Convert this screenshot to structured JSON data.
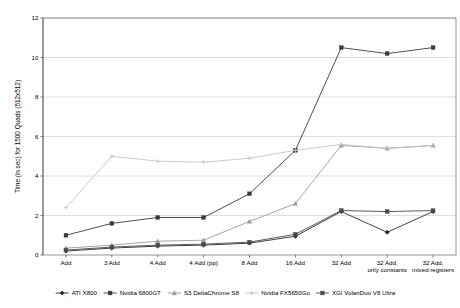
{
  "chart_data": {
    "type": "line",
    "title": "",
    "xlabel": "",
    "ylabel": "Time (in sec) for 1500 Quads (512x512)",
    "ylim": [
      0,
      12
    ],
    "ytick_labels": [
      "0",
      "2",
      "4",
      "6",
      "8",
      "10",
      "12"
    ],
    "ytick_values": [
      0,
      2,
      4,
      6,
      8,
      10,
      12
    ],
    "grid": true,
    "legend_position": "bottom",
    "categories": [
      "Add",
      "3 Add",
      "4 Add",
      "4 Add (pp)",
      "8 Add",
      "16 Add",
      "32 Add",
      "32 Add, only constants",
      "32 Add, mixed registers"
    ],
    "series": [
      {
        "name": "ATI X800",
        "color": "#2b2b2b",
        "marker": "diamond",
        "values": [
          0.2,
          0.35,
          0.45,
          0.5,
          0.6,
          0.95,
          2.2,
          1.15,
          2.2
        ]
      },
      {
        "name": "Nvidia 6800GT",
        "color": "#3a3a3a",
        "marker": "square",
        "values": [
          1.0,
          1.6,
          1.9,
          1.9,
          3.1,
          5.3,
          10.5,
          10.2,
          10.5
        ]
      },
      {
        "name": "S3 DeltaChrome S8",
        "color": "#9a9a9a",
        "marker": "triangle",
        "values": [
          0.35,
          0.5,
          0.7,
          0.75,
          1.7,
          2.6,
          5.55,
          5.4,
          5.55
        ]
      },
      {
        "name": "Nvidia FX5650Go",
        "color": "#c4c4c4",
        "marker": "cross",
        "values": [
          2.4,
          5.0,
          4.75,
          4.7,
          4.9,
          5.3,
          5.6,
          5.4,
          5.55
        ]
      },
      {
        "name": "XGI VolariDuo V8 Ultra",
        "color": "#4a4a4a",
        "marker": "square",
        "values": [
          0.25,
          0.4,
          0.5,
          0.55,
          0.65,
          1.05,
          2.25,
          2.2,
          2.25
        ]
      }
    ]
  }
}
